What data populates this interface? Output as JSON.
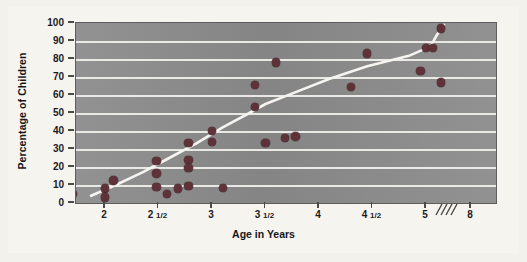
{
  "figure": {
    "background_color": "#f6f4ef",
    "plot_background_color": "#8d8d8d",
    "gridline_color": "#f2f1ee",
    "point_color": "#5e3238",
    "trendline_color": "#f5f4f0"
  },
  "chart_data": {
    "type": "scatter",
    "title": "",
    "xlabel": "Age in Years",
    "ylabel": "Percentage of Children",
    "grid": true,
    "legend": "none",
    "ylim": [
      0,
      100
    ],
    "yticks": [
      0,
      10,
      20,
      30,
      40,
      50,
      60,
      70,
      80,
      90,
      100
    ],
    "ytick_labels": [
      "0",
      "10",
      "20",
      "30",
      "40",
      "50",
      "60",
      "70",
      "80",
      "90",
      "100"
    ],
    "xtick_labels": [
      "2",
      "2 1/2",
      "3",
      "3 1/2",
      "4",
      "4 1/2",
      "5",
      "8"
    ],
    "xtick_values": [
      2,
      2.5,
      3,
      3.5,
      4,
      4.5,
      5,
      8
    ],
    "axis_break": {
      "label": "////",
      "between": [
        "5",
        "8"
      ],
      "marks": 4
    },
    "points": [
      {
        "x": 1.7,
        "y": 5
      },
      {
        "x": 2.0,
        "y": 8
      },
      {
        "x": 2.0,
        "y": 3
      },
      {
        "x": 2.08,
        "y": 12.5
      },
      {
        "x": 2.48,
        "y": 23.5
      },
      {
        "x": 2.48,
        "y": 16.5
      },
      {
        "x": 2.48,
        "y": 9
      },
      {
        "x": 2.58,
        "y": 5
      },
      {
        "x": 2.68,
        "y": 8
      },
      {
        "x": 2.78,
        "y": 33.5
      },
      {
        "x": 2.78,
        "y": 24
      },
      {
        "x": 2.78,
        "y": 19.5
      },
      {
        "x": 2.78,
        "y": 9.5
      },
      {
        "x": 3.0,
        "y": 40
      },
      {
        "x": 3.0,
        "y": 34
      },
      {
        "x": 3.1,
        "y": 8.5
      },
      {
        "x": 3.4,
        "y": 65.5
      },
      {
        "x": 3.4,
        "y": 53.5
      },
      {
        "x": 3.5,
        "y": 33.5
      },
      {
        "x": 3.6,
        "y": 78
      },
      {
        "x": 3.68,
        "y": 36
      },
      {
        "x": 3.78,
        "y": 37
      },
      {
        "x": 4.3,
        "y": 64.5
      },
      {
        "x": 4.45,
        "y": 83
      },
      {
        "x": 4.95,
        "y": 73.5
      },
      {
        "x": 5.0,
        "y": 86
      },
      {
        "x": 5.45,
        "y": 86
      },
      {
        "x": 6.0,
        "y": 97
      },
      {
        "x": 6.0,
        "y": 67
      }
    ],
    "trendline": [
      {
        "x": 1.87,
        "y": 4
      },
      {
        "x": 2.1,
        "y": 10
      },
      {
        "x": 2.35,
        "y": 17
      },
      {
        "x": 2.6,
        "y": 25
      },
      {
        "x": 2.85,
        "y": 33
      },
      {
        "x": 3.1,
        "y": 42
      },
      {
        "x": 3.35,
        "y": 50
      },
      {
        "x": 3.5,
        "y": 55
      },
      {
        "x": 3.8,
        "y": 62
      },
      {
        "x": 4.1,
        "y": 69
      },
      {
        "x": 4.45,
        "y": 76
      },
      {
        "x": 4.85,
        "y": 82
      },
      {
        "x": 5.3,
        "y": 87
      },
      {
        "x": 5.7,
        "y": 93
      },
      {
        "x": 6.2,
        "y": 99
      }
    ]
  }
}
